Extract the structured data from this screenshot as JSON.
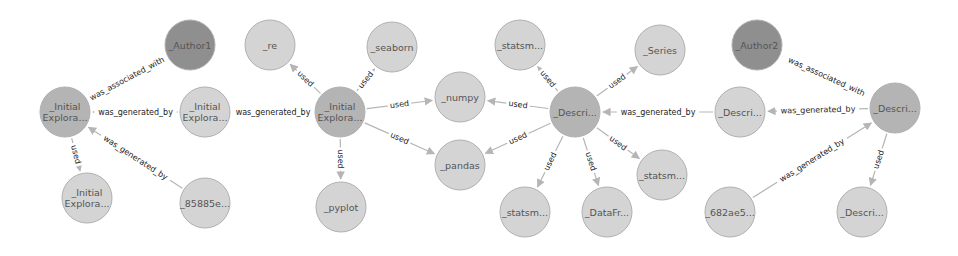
{
  "colors": {
    "light": "#d4d4d4",
    "medium": "#b4b4b4",
    "dark": "#8f8f8f",
    "edge": "#b5b5b5",
    "label": "#222222"
  },
  "nodes": [
    {
      "id": "author1",
      "lines": [
        "_Author1"
      ],
      "x": 190,
      "y": 45,
      "tone": "dark"
    },
    {
      "id": "ie_main",
      "lines": [
        "_Initial",
        "Explora..."
      ],
      "x": 65,
      "y": 112,
      "tone": "medium"
    },
    {
      "id": "ie_act1",
      "lines": [
        "_Initial",
        "Explora..."
      ],
      "x": 205,
      "y": 112,
      "tone": "light"
    },
    {
      "id": "ie_used",
      "lines": [
        "_Initial",
        "Explora..."
      ],
      "x": 87,
      "y": 198,
      "tone": "light"
    },
    {
      "id": "h85885e",
      "lines": [
        "_85885e..."
      ],
      "x": 205,
      "y": 203,
      "tone": "light"
    },
    {
      "id": "re",
      "lines": [
        "_re"
      ],
      "x": 270,
      "y": 45,
      "tone": "light"
    },
    {
      "id": "seaborn",
      "lines": [
        "_seaborn"
      ],
      "x": 392,
      "y": 47,
      "tone": "light"
    },
    {
      "id": "ie_hub",
      "lines": [
        "_Initial",
        "Explora..."
      ],
      "x": 340,
      "y": 112,
      "tone": "medium"
    },
    {
      "id": "numpy",
      "lines": [
        "_numpy"
      ],
      "x": 460,
      "y": 97,
      "tone": "light"
    },
    {
      "id": "pandas",
      "lines": [
        "_pandas"
      ],
      "x": 460,
      "y": 165,
      "tone": "light"
    },
    {
      "id": "pyplot",
      "lines": [
        "_pyplot"
      ],
      "x": 341,
      "y": 207,
      "tone": "light"
    },
    {
      "id": "statsm_top",
      "lines": [
        "_statsm..."
      ],
      "x": 520,
      "y": 45,
      "tone": "light"
    },
    {
      "id": "series",
      "lines": [
        "_Series"
      ],
      "x": 660,
      "y": 50,
      "tone": "light"
    },
    {
      "id": "descri_hub",
      "lines": [
        "_Descri..."
      ],
      "x": 575,
      "y": 112,
      "tone": "medium"
    },
    {
      "id": "statsm_right",
      "lines": [
        "_statsm..."
      ],
      "x": 662,
      "y": 175,
      "tone": "light"
    },
    {
      "id": "statsm_bottom",
      "lines": [
        "_statsm..."
      ],
      "x": 525,
      "y": 212,
      "tone": "light"
    },
    {
      "id": "datafr",
      "lines": [
        "_DataFr..."
      ],
      "x": 607,
      "y": 212,
      "tone": "light"
    },
    {
      "id": "author2",
      "lines": [
        "_Author2"
      ],
      "x": 757,
      "y": 45,
      "tone": "dark"
    },
    {
      "id": "descri_mid",
      "lines": [
        "_Descri..."
      ],
      "x": 740,
      "y": 112,
      "tone": "light"
    },
    {
      "id": "descri_right",
      "lines": [
        "_Descri..."
      ],
      "x": 895,
      "y": 108,
      "tone": "medium"
    },
    {
      "id": "h682ae5",
      "lines": [
        "_682ae5..."
      ],
      "x": 730,
      "y": 212,
      "tone": "light"
    },
    {
      "id": "descri_bottom",
      "lines": [
        "_Descri..."
      ],
      "x": 862,
      "y": 212,
      "tone": "light"
    }
  ],
  "edges": [
    {
      "from": "ie_main",
      "to": "author1",
      "label": "was_associated_with"
    },
    {
      "from": "ie_act1",
      "to": "ie_main",
      "label": "was_generated_by"
    },
    {
      "from": "h85885e",
      "to": "ie_main",
      "label": "was_generated_by"
    },
    {
      "from": "ie_main",
      "to": "ie_used",
      "label": "used"
    },
    {
      "from": "ie_hub",
      "to": "ie_act1",
      "label": "was_generated_by"
    },
    {
      "from": "ie_hub",
      "to": "re",
      "label": "used"
    },
    {
      "from": "ie_hub",
      "to": "seaborn",
      "label": "used"
    },
    {
      "from": "ie_hub",
      "to": "numpy",
      "label": "used"
    },
    {
      "from": "ie_hub",
      "to": "pandas",
      "label": "used"
    },
    {
      "from": "ie_hub",
      "to": "pyplot",
      "label": "used"
    },
    {
      "from": "descri_hub",
      "to": "statsm_top",
      "label": "used"
    },
    {
      "from": "descri_hub",
      "to": "series",
      "label": "used"
    },
    {
      "from": "descri_hub",
      "to": "numpy",
      "label": "used"
    },
    {
      "from": "descri_hub",
      "to": "pandas",
      "label": "used"
    },
    {
      "from": "descri_hub",
      "to": "statsm_bottom",
      "label": "used"
    },
    {
      "from": "descri_hub",
      "to": "datafr",
      "label": "used"
    },
    {
      "from": "descri_hub",
      "to": "statsm_right",
      "label": "used"
    },
    {
      "from": "descri_mid",
      "to": "descri_hub",
      "label": "was_generated_by"
    },
    {
      "from": "descri_right",
      "to": "descri_mid",
      "label": "was_generated_by"
    },
    {
      "from": "descri_right",
      "to": "author2",
      "label": "was_associated_with"
    },
    {
      "from": "h682ae5",
      "to": "descri_right",
      "label": "was_generated_by"
    },
    {
      "from": "descri_right",
      "to": "descri_bottom",
      "label": "used"
    }
  ],
  "node_radius": 25
}
